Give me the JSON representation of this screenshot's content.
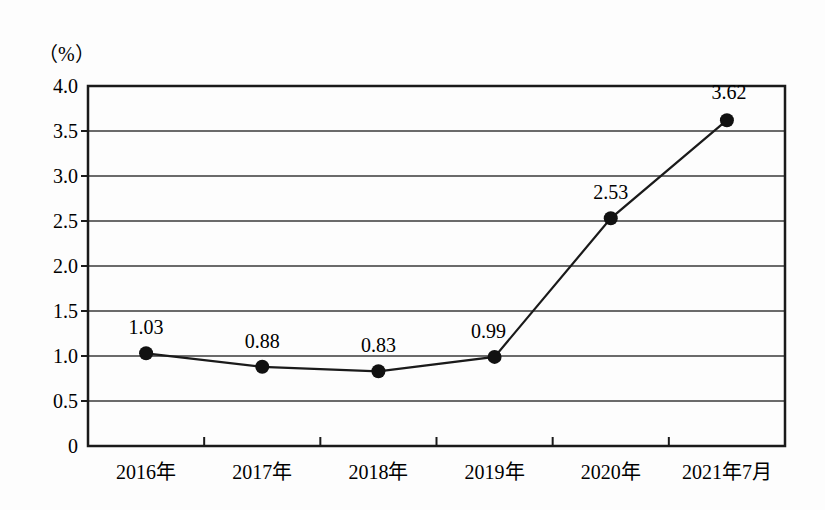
{
  "chart_data": {
    "type": "line",
    "title": "",
    "subtitle": "",
    "xlabel": "",
    "ylabel": "（%）",
    "unit_label": "（%）",
    "categories": [
      "2016年",
      "2017年",
      "2018年",
      "2019年",
      "2020年",
      "2021年7月"
    ],
    "values": [
      1.03,
      0.88,
      0.83,
      0.99,
      2.53,
      3.62
    ],
    "point_labels": [
      "1.03",
      "0.88",
      "0.83",
      "0.99",
      "2.53",
      "3.62"
    ],
    "series": [
      {
        "name": "",
        "values": [
          1.03,
          0.88,
          0.83,
          0.99,
          2.53,
          3.62
        ]
      }
    ],
    "ylim": [
      0,
      4.0
    ],
    "y_ticks": [
      0,
      0.5,
      1.0,
      1.5,
      2.0,
      2.5,
      3.0,
      3.5,
      4.0
    ],
    "y_tick_labels": [
      "0",
      "0.5",
      "1.0",
      "1.5",
      "2.0",
      "2.5",
      "3.0",
      "3.5",
      "4.0"
    ],
    "grid": true,
    "grid_axis": "y",
    "legend": "none",
    "marker": "filled-circle",
    "line_color": "#1a1a1a",
    "marker_color": "#111111",
    "grid_color": "#3a3a3a",
    "axis_color": "#1a1a1a",
    "background_color": "#fdfdfd"
  }
}
